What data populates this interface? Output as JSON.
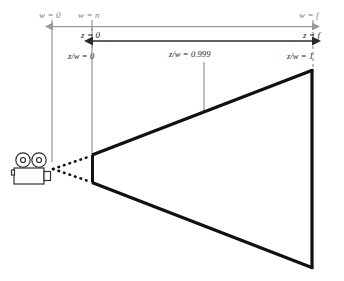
{
  "figure": {
    "type": "view-frustum-diagram"
  },
  "labels": {
    "w_near_origin": "w = 0",
    "w_at_n": "w = n",
    "w_at_f": "w = f",
    "z_at_zero": "z = 0",
    "z_at_f": "z = f",
    "zw_zero": "z/w = 0",
    "zw_mid": "z/w = 0.999",
    "zw_one": "z/w = 1"
  },
  "icons": {
    "camera": "movie-camera-icon"
  },
  "colors": {
    "frustum_stroke": "#111111",
    "guide_line": "#8a8a8a",
    "w_arrow": "#9a9a9a",
    "z_arrow": "#2a2a2a",
    "label_gray": "#6e6e6e",
    "label_dark": "#1b1b1b",
    "background": "#ffffff"
  },
  "geometry": {
    "near_plane_x": 92,
    "far_plane_x": 313,
    "camera_origin_x": 52,
    "mid_guide_x": 204,
    "near_top_y": 155,
    "near_bottom_y": 182,
    "far_top_y": 70,
    "far_bottom_y": 268
  }
}
